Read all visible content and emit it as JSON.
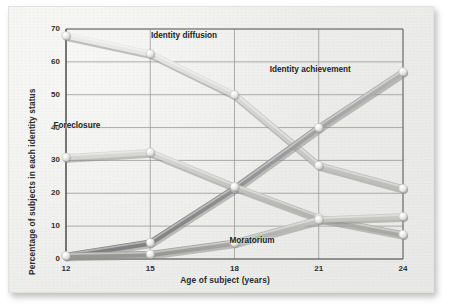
{
  "figure": {
    "background_color": "#efefed",
    "frame_color": "#e2e2e0"
  },
  "chart_data": {
    "type": "line",
    "title": "",
    "xlabel": "Age of subject (years)",
    "ylabel": "Percentage of subjects in each identity status",
    "x": [
      12,
      15,
      18,
      21,
      24
    ],
    "xtick_labels": [
      "12",
      "15",
      "18",
      "21",
      "24"
    ],
    "ytick_labels": [
      "0",
      "10",
      "20",
      "30",
      "40",
      "50",
      "60",
      "70"
    ],
    "yticks": [
      0,
      10,
      20,
      30,
      40,
      50,
      60,
      70
    ],
    "xlim": [
      12,
      24
    ],
    "ylim": [
      0,
      70
    ],
    "grid": true,
    "legend_position": "inline-annotations",
    "series": [
      {
        "name": "Identity diffusion",
        "values": [
          68,
          62.5,
          50,
          28.5,
          21.5
        ],
        "color": "#d4d4d2",
        "label_x_pct": 33.5,
        "label_y_pct": 8.5
      },
      {
        "name": "Identity achievement",
        "values": [
          1,
          5,
          21.5,
          40,
          57
        ],
        "color": "#98989a",
        "label_x_pct": 61.5,
        "label_y_pct": 20.5
      },
      {
        "name": "Foreclosure",
        "values": [
          31,
          32.5,
          22,
          12.5,
          7.5
        ],
        "color": "#c0c0bd",
        "label_x_pct": 10.5,
        "label_y_pct": 40.0
      },
      {
        "name": "Moratorium",
        "values": [
          1,
          1.5,
          5,
          12,
          13
        ],
        "color": "#b1b1ae",
        "label_x_pct": 52.0,
        "label_y_pct": 80.5
      }
    ]
  }
}
